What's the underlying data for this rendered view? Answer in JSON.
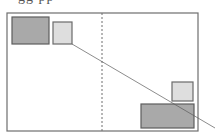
{
  "caption": {
    "text": "gg pp",
    "note": "partially visible text cut off at top edge"
  },
  "diagram": {
    "frame": {
      "x": 7,
      "y": 13,
      "width": 191,
      "height": 118,
      "stroke": "#6e6e6e"
    },
    "divider": {
      "x": 102,
      "y1": 13,
      "y2": 131,
      "stroke": "#6e6e6e",
      "style": "dashed"
    },
    "shapes": [
      {
        "id": "top-left-dark-rect",
        "x": 12,
        "y": 17,
        "width": 37,
        "height": 27,
        "fill": "#a9a9a9",
        "stroke": "#5e5e5e"
      },
      {
        "id": "top-left-light-square",
        "x": 53,
        "y": 22,
        "width": 19,
        "height": 22,
        "fill": "#dedede",
        "stroke": "#6a6a6a"
      },
      {
        "id": "bottom-right-light-square",
        "x": 172,
        "y": 82,
        "width": 21,
        "height": 19,
        "fill": "#dedede",
        "stroke": "#6a6a6a"
      },
      {
        "id": "bottom-right-dark-rect",
        "x": 141,
        "y": 104,
        "width": 53,
        "height": 24,
        "fill": "#a9a9a9",
        "stroke": "#5e5e5e"
      }
    ],
    "connector": {
      "x1": 72,
      "y1": 44,
      "x2": 215,
      "y2": 128,
      "stroke": "#5a5a5a"
    }
  }
}
